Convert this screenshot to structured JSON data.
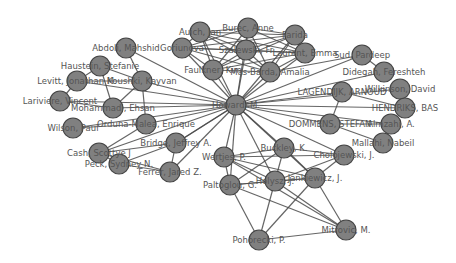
{
  "diagram": {
    "type": "network-graph",
    "hub": "Howard, M.",
    "colors": {
      "node_fill": "#808080",
      "node_stroke": "#444444",
      "edge": "#4a4a4a",
      "label": "#555555",
      "background": "#ffffff"
    },
    "node_radius": 10,
    "nodes": [
      {
        "id": "howard",
        "label": "Howard, M.",
        "x": 236,
        "y": 105
      },
      {
        "id": "auich",
        "label": "Auich, Jan",
        "x": 200,
        "y": 32
      },
      {
        "id": "burec",
        "label": "Burec, Anne",
        "x": 248,
        "y": 28
      },
      {
        "id": "farida",
        "label": "Farida",
        "x": 295,
        "y": 35
      },
      {
        "id": "goriunova",
        "label": "Goriunova",
        "x": 182,
        "y": 48
      },
      {
        "id": "fr",
        "label": "Szalewski, Fr",
        "x": 246,
        "y": 50
      },
      {
        "id": "emma",
        "label": "Laurent, Emma",
        "x": 305,
        "y": 53
      },
      {
        "id": "faulkner",
        "label": "Faulkner, Kim",
        "x": 213,
        "y": 70
      },
      {
        "id": "amalia",
        "label": "Mas-Barda, Amalia",
        "x": 270,
        "y": 72
      },
      {
        "id": "abdoli",
        "label": "Abdoli, Mahshid",
        "x": 126,
        "y": 48
      },
      {
        "id": "haustein",
        "label": "Haustein, Stefanie",
        "x": 100,
        "y": 66
      },
      {
        "id": "koushki",
        "label": "Koushki, Kayvan",
        "x": 142,
        "y": 81
      },
      {
        "id": "levitt",
        "label": "Levitt, Jonathan M.",
        "x": 77,
        "y": 81
      },
      {
        "id": "lariviere",
        "label": "Lariviere, Vincent",
        "x": 60,
        "y": 101
      },
      {
        "id": "mohammadi",
        "label": "Mohammadi, Ehsan",
        "x": 113,
        "y": 108
      },
      {
        "id": "ordunamalea",
        "label": "Orduna-Malea, Enrique",
        "x": 146,
        "y": 124
      },
      {
        "id": "wilson",
        "label": "Wilson, Paul",
        "x": 73,
        "y": 128
      },
      {
        "id": "cash",
        "label": "Cash, Scottye J",
        "x": 99,
        "y": 153
      },
      {
        "id": "bridge",
        "label": "Bridge, Jeffrey A.",
        "x": 176,
        "y": 143
      },
      {
        "id": "peck",
        "label": "Peck, Sydney N.",
        "x": 119,
        "y": 164
      },
      {
        "id": "ferrer",
        "label": "Ferrer, Jared Z.",
        "x": 170,
        "y": 172
      },
      {
        "id": "sud",
        "label": "Sud, Pardeep",
        "x": 362,
        "y": 55
      },
      {
        "id": "didegah",
        "label": "Didegah, Fereshteh",
        "x": 384,
        "y": 72
      },
      {
        "id": "lagendijk",
        "label": "LAGENDIJK, ARNOUD",
        "x": 342,
        "y": 92
      },
      {
        "id": "wilkinson",
        "label": "Wilkinson, David",
        "x": 400,
        "y": 89
      },
      {
        "id": "hendriks",
        "label": "HENDRIKS, BAS",
        "x": 405,
        "y": 108
      },
      {
        "id": "dommens",
        "label": "DOMMENS, STEFAN",
        "x": 330,
        "y": 124
      },
      {
        "id": "almzahi",
        "label": "Almzahi, A.",
        "x": 391,
        "y": 124
      },
      {
        "id": "mallahi",
        "label": "Mallahi, Nabeil",
        "x": 383,
        "y": 143
      },
      {
        "id": "cholo",
        "label": "Cholojewski, J.",
        "x": 344,
        "y": 155
      },
      {
        "id": "buckley",
        "label": "Buckley, K.",
        "x": 284,
        "y": 148
      },
      {
        "id": "wertjes",
        "label": "Wertjes, P.",
        "x": 224,
        "y": 157
      },
      {
        "id": "holysz",
        "label": "Holysz, J.",
        "x": 275,
        "y": 181
      },
      {
        "id": "jankiewicz",
        "label": "Jankiewicz, J.",
        "x": 315,
        "y": 178
      },
      {
        "id": "paltoglou",
        "label": "Paltoglou, G.",
        "x": 230,
        "y": 185
      },
      {
        "id": "pohorecki",
        "label": "Pohorecki, P.",
        "x": 259,
        "y": 240
      },
      {
        "id": "mitrovic",
        "label": "Mitrovic, M.",
        "x": 346,
        "y": 230
      }
    ],
    "edges": [
      [
        "howard",
        "auich"
      ],
      [
        "howard",
        "burec"
      ],
      [
        "howard",
        "farida"
      ],
      [
        "howard",
        "goriunova"
      ],
      [
        "howard",
        "fr"
      ],
      [
        "howard",
        "emma"
      ],
      [
        "howard",
        "faulkner"
      ],
      [
        "howard",
        "amalia"
      ],
      [
        "howard",
        "abdoli"
      ],
      [
        "howard",
        "koushki"
      ],
      [
        "howard",
        "levitt"
      ],
      [
        "howard",
        "lariviere"
      ],
      [
        "howard",
        "mohammadi"
      ],
      [
        "howard",
        "ordunamalea"
      ],
      [
        "howard",
        "wilson"
      ],
      [
        "howard",
        "cash"
      ],
      [
        "howard",
        "bridge"
      ],
      [
        "howard",
        "ferrer"
      ],
      [
        "howard",
        "sud"
      ],
      [
        "howard",
        "didegah"
      ],
      [
        "howard",
        "lagendijk"
      ],
      [
        "howard",
        "wilkinson"
      ],
      [
        "howard",
        "hendriks"
      ],
      [
        "howard",
        "dommens"
      ],
      [
        "howard",
        "almzahi"
      ],
      [
        "howard",
        "cholo"
      ],
      [
        "howard",
        "buckley"
      ],
      [
        "howard",
        "wertjes"
      ],
      [
        "howard",
        "holysz"
      ],
      [
        "howard",
        "jankiewicz"
      ],
      [
        "howard",
        "paltoglou"
      ],
      [
        "auich",
        "burec"
      ],
      [
        "auich",
        "farida"
      ],
      [
        "auich",
        "goriunova"
      ],
      [
        "auich",
        "fr"
      ],
      [
        "auich",
        "emma"
      ],
      [
        "auich",
        "faulkner"
      ],
      [
        "auich",
        "amalia"
      ],
      [
        "burec",
        "farida"
      ],
      [
        "burec",
        "goriunova"
      ],
      [
        "burec",
        "fr"
      ],
      [
        "burec",
        "emma"
      ],
      [
        "burec",
        "faulkner"
      ],
      [
        "burec",
        "amalia"
      ],
      [
        "farida",
        "goriunova"
      ],
      [
        "farida",
        "fr"
      ],
      [
        "farida",
        "emma"
      ],
      [
        "farida",
        "faulkner"
      ],
      [
        "farida",
        "amalia"
      ],
      [
        "goriunova",
        "fr"
      ],
      [
        "goriunova",
        "emma"
      ],
      [
        "goriunova",
        "faulkner"
      ],
      [
        "goriunova",
        "amalia"
      ],
      [
        "fr",
        "emma"
      ],
      [
        "fr",
        "faulkner"
      ],
      [
        "fr",
        "amalia"
      ],
      [
        "emma",
        "faulkner"
      ],
      [
        "emma",
        "amalia"
      ],
      [
        "faulkner",
        "amalia"
      ],
      [
        "abdoli",
        "koushki"
      ],
      [
        "haustein",
        "koushki"
      ],
      [
        "haustein",
        "levitt"
      ],
      [
        "haustein",
        "mohammadi"
      ],
      [
        "levitt",
        "lariviere"
      ],
      [
        "levitt",
        "koushki"
      ],
      [
        "koushki",
        "mohammadi"
      ],
      [
        "koushki",
        "ordunamalea"
      ],
      [
        "lariviere",
        "mohammadi"
      ],
      [
        "wilson",
        "ordunamalea"
      ],
      [
        "cash",
        "bridge"
      ],
      [
        "cash",
        "peck"
      ],
      [
        "cash",
        "ferrer"
      ],
      [
        "peck",
        "bridge"
      ],
      [
        "peck",
        "ferrer"
      ],
      [
        "bridge",
        "ferrer"
      ],
      [
        "bridge",
        "howard"
      ],
      [
        "ordunamalea",
        "cash"
      ],
      [
        "sud",
        "didegah"
      ],
      [
        "lagendijk",
        "dommens"
      ],
      [
        "lagendijk",
        "hendriks"
      ],
      [
        "wilkinson",
        "hendriks"
      ],
      [
        "dommens",
        "almzahi"
      ],
      [
        "dommens",
        "mallahi"
      ],
      [
        "amalia",
        "sud"
      ],
      [
        "wertjes",
        "buckley"
      ],
      [
        "wertjes",
        "paltoglou"
      ],
      [
        "wertjes",
        "holysz"
      ],
      [
        "wertjes",
        "jankiewicz"
      ],
      [
        "wertjes",
        "cholo"
      ],
      [
        "wertjes",
        "mitrovic"
      ],
      [
        "buckley",
        "paltoglou"
      ],
      [
        "buckley",
        "holysz"
      ],
      [
        "buckley",
        "jankiewicz"
      ],
      [
        "buckley",
        "cholo"
      ],
      [
        "holysz",
        "paltoglou"
      ],
      [
        "holysz",
        "jankiewicz"
      ],
      [
        "holysz",
        "pohorecki"
      ],
      [
        "holysz",
        "mitrovic"
      ],
      [
        "holysz",
        "cholo"
      ],
      [
        "jankiewicz",
        "paltoglou"
      ],
      [
        "jankiewicz",
        "pohorecki"
      ],
      [
        "jankiewicz",
        "mitrovic"
      ],
      [
        "jankiewicz",
        "cholo"
      ],
      [
        "paltoglou",
        "pohorecki"
      ],
      [
        "paltoglou",
        "mitrovic"
      ],
      [
        "pohorecki",
        "mitrovic"
      ]
    ]
  }
}
